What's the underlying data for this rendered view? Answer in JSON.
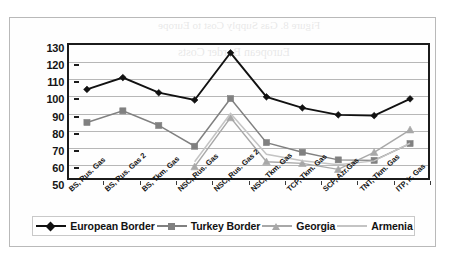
{
  "chart_data": {
    "type": "line",
    "title": "",
    "subtitle": "",
    "xlabel": "",
    "ylabel": "",
    "ylim": [
      50,
      130
    ],
    "ytick_step": 10,
    "yticks": [
      130,
      120,
      110,
      100,
      90,
      80,
      70,
      60,
      50
    ],
    "grid": true,
    "legend_position": "bottom",
    "categories": [
      "BS, Rus. Gas",
      "BS, Rus. Gas 2",
      "BS, Tkm. Gas",
      "NSC, Rus. Gas",
      "NSC, Rus. Gas 2",
      "NSC, Tkm. Gas",
      "TCP, Tkm. Gas",
      "SCP, Azr.Gas",
      "TNT, Tkm. Gas",
      "ITP, Ir. Gas"
    ],
    "series": [
      {
        "name": "European Border",
        "color": "#111111",
        "marker": "diamond",
        "values": [
          103.3,
          110.4,
          101.3,
          96.9,
          125.3,
          98.8,
          92.2,
          88.0,
          87.5,
          97.6
        ]
      },
      {
        "name": "Turkey Border",
        "color": "#808080",
        "marker": "square",
        "values": [
          83.4,
          90.4,
          81.6,
          69.1,
          97.8,
          71.3,
          65.5,
          60.9,
          60.6,
          70.7
        ]
      },
      {
        "name": "Georgia",
        "color": "#a8a8a8",
        "marker": "triangle",
        "values": [
          null,
          null,
          null,
          56.8,
          86.3,
          59.8,
          58.8,
          55.2,
          65.4,
          79.0
        ]
      },
      {
        "name": "Armenia",
        "color": "#c4c4c4",
        "marker": "none",
        "values": [
          null,
          null,
          null,
          59.8,
          88.8,
          64.3,
          60.4,
          58.0,
          60.3,
          70.9
        ]
      }
    ]
  },
  "legend": {
    "items": [
      {
        "label": "European Border"
      },
      {
        "label": "Turkey Border"
      },
      {
        "label": "Georgia"
      },
      {
        "label": "Armenia"
      }
    ]
  },
  "ghost_text": {
    "line1": "Figure 8. Gas Supply Cost to Europe",
    "line2": "European Border Costs"
  }
}
